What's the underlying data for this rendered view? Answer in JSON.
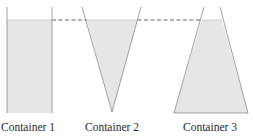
{
  "diagram": {
    "title": "",
    "colors": {
      "liquid_fill": "#e6e6e6",
      "wall_stroke": "#8a8a8a",
      "level_line": "#555555",
      "label_text": "#2a2a2a"
    },
    "containers": [
      {
        "label": "Container 1",
        "shape": "rectangle"
      },
      {
        "label": "Container 2",
        "shape": "inverted-cone"
      },
      {
        "label": "Container 3",
        "shape": "truncated-cone-wide-base"
      }
    ],
    "level_line": {
      "style": "dashed"
    }
  }
}
